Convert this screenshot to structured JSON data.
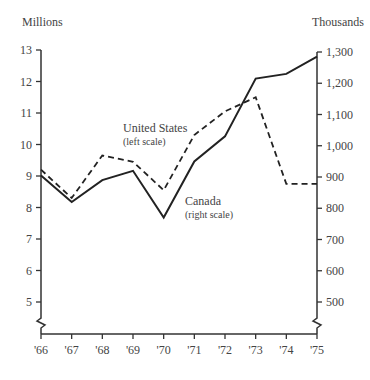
{
  "chart_data": {
    "type": "line",
    "title": "",
    "xlabel": "",
    "ylabel_left": "Millions",
    "ylabel_right": "Thousands",
    "categories": [
      "'66",
      "'67",
      "'68",
      "'69",
      "'70",
      "'71",
      "'72",
      "'73",
      "'74",
      "'75"
    ],
    "left_axis": {
      "ticks": [
        "5",
        "6",
        "7",
        "8",
        "9",
        "10",
        "11",
        "12",
        "13"
      ],
      "range": [
        4.5,
        13
      ],
      "broken": true
    },
    "right_axis": {
      "ticks": [
        "500",
        "600",
        "700",
        "800",
        "900",
        "1,000",
        "1,100",
        "1,200",
        "1,300"
      ],
      "range": [
        450,
        1300
      ],
      "broken": true
    },
    "grid": false,
    "series": [
      {
        "name": "United States",
        "annotation": "United States",
        "annotation_sub": "(left scale)",
        "axis": "left",
        "style": "dashed",
        "values": [
          9.2,
          8.3,
          9.65,
          9.45,
          8.55,
          10.3,
          11.05,
          11.5,
          8.75,
          8.75
        ]
      },
      {
        "name": "Canada",
        "annotation": "Canada",
        "annotation_sub": "(right scale)",
        "axis": "right",
        "style": "solid",
        "values": [
          905,
          820,
          890,
          920,
          770,
          950,
          1030,
          1215,
          1230,
          1285
        ]
      }
    ]
  }
}
